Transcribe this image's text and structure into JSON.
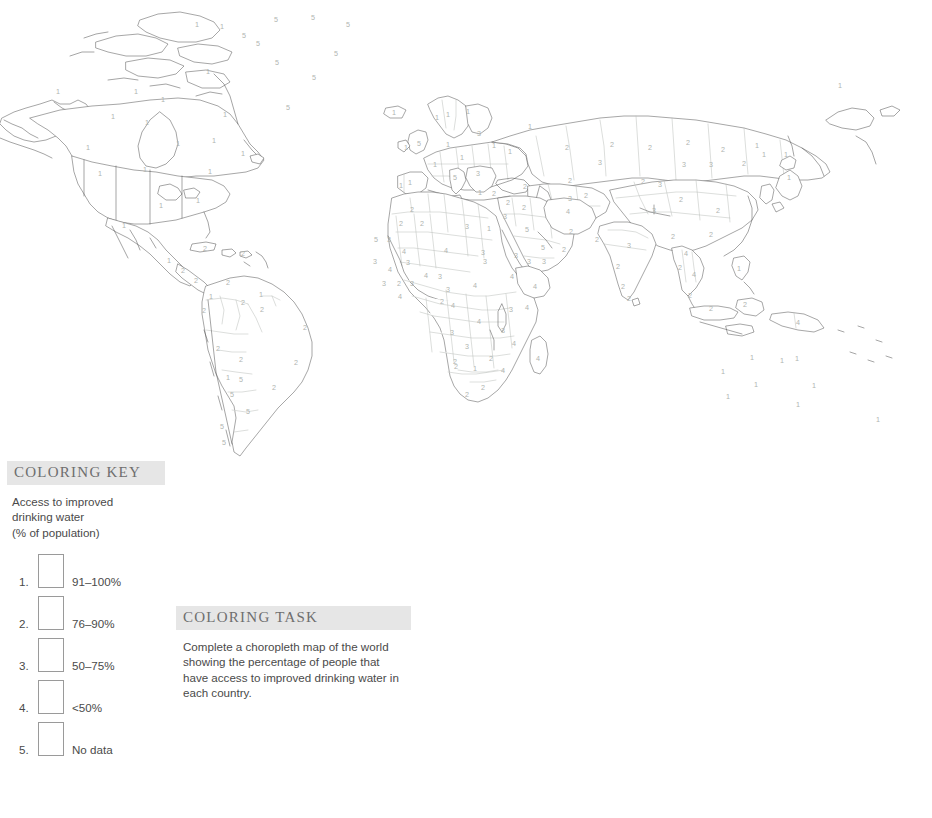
{
  "map": {
    "title": "blank-outline-world-map",
    "description": "Outline world map with country boundaries and a small color-by-number digit inside each country",
    "number_color": "#b0b4b0",
    "outline_color": "#5d5d5d",
    "inner_border_color": "#b9bcb8",
    "fill_color": "#ffffff",
    "country_numbers": [
      {
        "region": "Alaska",
        "value": "1",
        "x": 58,
        "y": 92
      },
      {
        "region": "Canada NW",
        "value": "1",
        "x": 136,
        "y": 92
      },
      {
        "region": "Canada Arctic",
        "value": "1",
        "x": 163,
        "y": 100
      },
      {
        "region": "Canada N",
        "value": "1",
        "x": 197,
        "y": 25
      },
      {
        "region": "Canada NE",
        "value": "1",
        "x": 222,
        "y": 27
      },
      {
        "region": "Nunavut",
        "value": "1",
        "x": 225,
        "y": 115
      },
      {
        "region": "Canada C",
        "value": "1",
        "x": 113,
        "y": 117
      },
      {
        "region": "Canada Hudson",
        "value": "1",
        "x": 208,
        "y": 72
      },
      {
        "region": "Canada Prairies",
        "value": "1",
        "x": 147,
        "y": 123
      },
      {
        "region": "Canada Ontario",
        "value": "1",
        "x": 178,
        "y": 144
      },
      {
        "region": "Canada Quebec",
        "value": "1",
        "x": 214,
        "y": 141
      },
      {
        "region": "Canada East",
        "value": "1",
        "x": 243,
        "y": 154
      },
      {
        "region": "Greenland NW",
        "value": "5",
        "x": 276,
        "y": 20
      },
      {
        "region": "Greenland N",
        "value": "5",
        "x": 313,
        "y": 18
      },
      {
        "region": "Greenland NE",
        "value": "5",
        "x": 348,
        "y": 25
      },
      {
        "region": "Greenland W",
        "value": "5",
        "x": 244,
        "y": 36
      },
      {
        "region": "Greenland C",
        "value": "5",
        "x": 258,
        "y": 44
      },
      {
        "region": "Greenland CE",
        "value": "5",
        "x": 336,
        "y": 54
      },
      {
        "region": "Greenland SW",
        "value": "5",
        "x": 277,
        "y": 63
      },
      {
        "region": "Greenland S",
        "value": "5",
        "x": 314,
        "y": 78
      },
      {
        "region": "Greenland SS",
        "value": "5",
        "x": 288,
        "y": 108
      },
      {
        "region": "USA NW",
        "value": "1",
        "x": 88,
        "y": 148
      },
      {
        "region": "USA W",
        "value": "1",
        "x": 100,
        "y": 174
      },
      {
        "region": "USA C",
        "value": "1",
        "x": 145,
        "y": 170
      },
      {
        "region": "USA NE",
        "value": "1",
        "x": 210,
        "y": 172
      },
      {
        "region": "USA Midwest",
        "value": "1",
        "x": 161,
        "y": 206
      },
      {
        "region": "USA S",
        "value": "1",
        "x": 198,
        "y": 201
      },
      {
        "region": "Mexico N",
        "value": "1",
        "x": 124,
        "y": 226
      },
      {
        "region": "Mexico S",
        "value": "1",
        "x": 169,
        "y": 261
      },
      {
        "region": "Guatemala",
        "value": "2",
        "x": 183,
        "y": 271
      },
      {
        "region": "Cuba",
        "value": "2",
        "x": 205,
        "y": 249
      },
      {
        "region": "Caribbean E",
        "value": "2",
        "x": 243,
        "y": 254
      },
      {
        "region": "Central America S",
        "value": "2",
        "x": 196,
        "y": 281
      },
      {
        "region": "Colombia",
        "value": "1",
        "x": 211,
        "y": 297
      },
      {
        "region": "Venezuela",
        "value": "2",
        "x": 228,
        "y": 283
      },
      {
        "region": "Guyana",
        "value": "1",
        "x": 261,
        "y": 295
      },
      {
        "region": "Suriname",
        "value": "2",
        "x": 262,
        "y": 310
      },
      {
        "region": "Ecuador",
        "value": "2",
        "x": 204,
        "y": 311
      },
      {
        "region": "Brazil N",
        "value": "2",
        "x": 243,
        "y": 303
      },
      {
        "region": "Brazil E",
        "value": "2",
        "x": 305,
        "y": 328
      },
      {
        "region": "Brazil C",
        "value": "2",
        "x": 241,
        "y": 360
      },
      {
        "region": "Brazil S",
        "value": "2",
        "x": 296,
        "y": 363
      },
      {
        "region": "Peru",
        "value": "2",
        "x": 218,
        "y": 349
      },
      {
        "region": "Bolivia",
        "value": "1",
        "x": 228,
        "y": 378
      },
      {
        "region": "Paraguay",
        "value": "5",
        "x": 241,
        "y": 380
      },
      {
        "region": "Uruguay",
        "value": "2",
        "x": 274,
        "y": 388
      },
      {
        "region": "Argentina N",
        "value": "5",
        "x": 232,
        "y": 395
      },
      {
        "region": "Argentina C",
        "value": "5",
        "x": 248,
        "y": 412
      },
      {
        "region": "Chile N",
        "value": "5",
        "x": 222,
        "y": 427
      },
      {
        "region": "Argentina S",
        "value": "5",
        "x": 224,
        "y": 443
      },
      {
        "region": "Iceland",
        "value": "1",
        "x": 394,
        "y": 113
      },
      {
        "region": "Norway",
        "value": "1",
        "x": 437,
        "y": 118
      },
      {
        "region": "Sweden",
        "value": "1",
        "x": 448,
        "y": 115
      },
      {
        "region": "Finland",
        "value": "1",
        "x": 468,
        "y": 112
      },
      {
        "region": "UK",
        "value": "5",
        "x": 419,
        "y": 144
      },
      {
        "region": "Ireland",
        "value": "1",
        "x": 406,
        "y": 148
      },
      {
        "region": "Denmark",
        "value": "1",
        "x": 448,
        "y": 145
      },
      {
        "region": "Baltic",
        "value": "3",
        "x": 479,
        "y": 134
      },
      {
        "region": "Poland",
        "value": "1",
        "x": 494,
        "y": 146
      },
      {
        "region": "Germany",
        "value": "1",
        "x": 462,
        "y": 158
      },
      {
        "region": "France",
        "value": "1",
        "x": 435,
        "y": 165
      },
      {
        "region": "Spain",
        "value": "1",
        "x": 410,
        "y": 183
      },
      {
        "region": "Portugal",
        "value": "1",
        "x": 401,
        "y": 186
      },
      {
        "region": "Italy",
        "value": "5",
        "x": 455,
        "y": 178
      },
      {
        "region": "Balkans",
        "value": "3",
        "x": 478,
        "y": 174
      },
      {
        "region": "Greece",
        "value": "1",
        "x": 480,
        "y": 193
      },
      {
        "region": "Turkey",
        "value": "2",
        "x": 494,
        "y": 194
      },
      {
        "region": "Ukraine",
        "value": "1",
        "x": 510,
        "y": 152
      },
      {
        "region": "Russia W",
        "value": "1",
        "x": 530,
        "y": 127
      },
      {
        "region": "Caucasus",
        "value": "2",
        "x": 525,
        "y": 187
      },
      {
        "region": "Russia C",
        "value": "2",
        "x": 567,
        "y": 148
      },
      {
        "region": "Russia Ural",
        "value": "3",
        "x": 600,
        "y": 163
      },
      {
        "region": "Kazakhstan",
        "value": "2",
        "x": 570,
        "y": 181
      },
      {
        "region": "Siberia W",
        "value": "2",
        "x": 612,
        "y": 145
      },
      {
        "region": "Siberia C",
        "value": "2",
        "x": 650,
        "y": 148
      },
      {
        "region": "Siberia E",
        "value": "2",
        "x": 688,
        "y": 143
      },
      {
        "region": "Siberia NE",
        "value": "2",
        "x": 723,
        "y": 150
      },
      {
        "region": "Russia Far E",
        "value": "1",
        "x": 757,
        "y": 146
      },
      {
        "region": "Russia Pacific",
        "value": "1",
        "x": 840,
        "y": 86
      },
      {
        "region": "Mongolia",
        "value": "3",
        "x": 660,
        "y": 185
      },
      {
        "region": "Mongolia W",
        "value": "3",
        "x": 684,
        "y": 165
      },
      {
        "region": "Mongolia E",
        "value": "3",
        "x": 711,
        "y": 165
      },
      {
        "region": "China N",
        "value": "2",
        "x": 744,
        "y": 164
      },
      {
        "region": "Korea",
        "value": "1",
        "x": 764,
        "y": 155
      },
      {
        "region": "Japan N",
        "value": "1",
        "x": 786,
        "y": 155
      },
      {
        "region": "Japan S",
        "value": "1",
        "x": 789,
        "y": 178
      },
      {
        "region": "China C",
        "value": "2",
        "x": 681,
        "y": 200
      },
      {
        "region": "China W",
        "value": "2",
        "x": 643,
        "y": 182
      },
      {
        "region": "China E",
        "value": "2",
        "x": 718,
        "y": 211
      },
      {
        "region": "China SE",
        "value": "2",
        "x": 711,
        "y": 235
      },
      {
        "region": "China S",
        "value": "2",
        "x": 673,
        "y": 237
      },
      {
        "region": "Nepal",
        "value": "3",
        "x": 654,
        "y": 211
      },
      {
        "region": "India N",
        "value": "3",
        "x": 629,
        "y": 246
      },
      {
        "region": "India C",
        "value": "2",
        "x": 618,
        "y": 267
      },
      {
        "region": "India S",
        "value": "2",
        "x": 623,
        "y": 287
      },
      {
        "region": "Sri Lanka",
        "value": "2",
        "x": 629,
        "y": 299
      },
      {
        "region": "Myanmar",
        "value": "4",
        "x": 686,
        "y": 254
      },
      {
        "region": "Thailand",
        "value": "2",
        "x": 680,
        "y": 268
      },
      {
        "region": "Vietnam",
        "value": "4",
        "x": 694,
        "y": 275
      },
      {
        "region": "Malaysia",
        "value": "2",
        "x": 690,
        "y": 296
      },
      {
        "region": "Philippines",
        "value": "1",
        "x": 739,
        "y": 269
      },
      {
        "region": "Indonesia W",
        "value": "2",
        "x": 711,
        "y": 309
      },
      {
        "region": "Indonesia C",
        "value": "2",
        "x": 745,
        "y": 305
      },
      {
        "region": "Papua New Guinea",
        "value": "4",
        "x": 798,
        "y": 323
      },
      {
        "region": "Australia NW",
        "value": "1",
        "x": 752,
        "y": 358
      },
      {
        "region": "Australia N",
        "value": "1",
        "x": 782,
        "y": 361
      },
      {
        "region": "Australia NE",
        "value": "1",
        "x": 797,
        "y": 359
      },
      {
        "region": "Australia W",
        "value": "1",
        "x": 723,
        "y": 372
      },
      {
        "region": "Australia C",
        "value": "1",
        "x": 756,
        "y": 385
      },
      {
        "region": "Australia E",
        "value": "1",
        "x": 814,
        "y": 386
      },
      {
        "region": "Australia SW",
        "value": "1",
        "x": 728,
        "y": 397
      },
      {
        "region": "Australia SE",
        "value": "1",
        "x": 798,
        "y": 405
      },
      {
        "region": "New Zealand",
        "value": "1",
        "x": 878,
        "y": 420
      },
      {
        "region": "Morocco",
        "value": "2",
        "x": 412,
        "y": 210
      },
      {
        "region": "Algeria",
        "value": "2",
        "x": 422,
        "y": 224
      },
      {
        "region": "Western Sahara",
        "value": "2",
        "x": 401,
        "y": 224
      },
      {
        "region": "Libya",
        "value": "3",
        "x": 467,
        "y": 227
      },
      {
        "region": "Egypt",
        "value": "1",
        "x": 489,
        "y": 229
      },
      {
        "region": "Sudan",
        "value": "3",
        "x": 485,
        "y": 262
      },
      {
        "region": "Mauritania",
        "value": "5",
        "x": 376,
        "y": 240
      },
      {
        "region": "Mali N",
        "value": "3",
        "x": 389,
        "y": 240
      },
      {
        "region": "Mali",
        "value": "4",
        "x": 404,
        "y": 252
      },
      {
        "region": "Niger",
        "value": "4",
        "x": 446,
        "y": 251
      },
      {
        "region": "Chad",
        "value": "3",
        "x": 483,
        "y": 253
      },
      {
        "region": "Senegal",
        "value": "3",
        "x": 375,
        "y": 262
      },
      {
        "region": "Guinea",
        "value": "4",
        "x": 390,
        "y": 270
      },
      {
        "region": "Burkina",
        "value": "3",
        "x": 408,
        "y": 263
      },
      {
        "region": "Benin",
        "value": "4",
        "x": 426,
        "y": 276
      },
      {
        "region": "Nigeria",
        "value": "3",
        "x": 440,
        "y": 277
      },
      {
        "region": "Sierra Leone",
        "value": "3",
        "x": 384,
        "y": 284
      },
      {
        "region": "Liberia",
        "value": "2",
        "x": 399,
        "y": 284
      },
      {
        "region": "Ivory Coast",
        "value": "3",
        "x": 412,
        "y": 284
      },
      {
        "region": "Cameroon",
        "value": "3",
        "x": 448,
        "y": 290
      },
      {
        "region": "CAR",
        "value": "4",
        "x": 475,
        "y": 286
      },
      {
        "region": "Ethiopia",
        "value": "4",
        "x": 512,
        "y": 277
      },
      {
        "region": "Somalia",
        "value": "4",
        "x": 535,
        "y": 287
      },
      {
        "region": "Eq Guinea",
        "value": "4",
        "x": 400,
        "y": 297
      },
      {
        "region": "Gabon",
        "value": "2",
        "x": 442,
        "y": 302
      },
      {
        "region": "Congo",
        "value": "4",
        "x": 453,
        "y": 306
      },
      {
        "region": "DRC",
        "value": "4",
        "x": 479,
        "y": 322
      },
      {
        "region": "Uganda",
        "value": "3",
        "x": 511,
        "y": 310
      },
      {
        "region": "Kenya",
        "value": "4",
        "x": 527,
        "y": 308
      },
      {
        "region": "Angola N",
        "value": "3",
        "x": 452,
        "y": 333
      },
      {
        "region": "Tanzania",
        "value": "3",
        "x": 503,
        "y": 331
      },
      {
        "region": "Zambia",
        "value": "3",
        "x": 467,
        "y": 347
      },
      {
        "region": "Mozambique",
        "value": "4",
        "x": 514,
        "y": 344
      },
      {
        "region": "Madagascar",
        "value": "4",
        "x": 538,
        "y": 359
      },
      {
        "region": "Zimbabwe",
        "value": "2",
        "x": 491,
        "y": 359
      },
      {
        "region": "Botswana",
        "value": "2",
        "x": 455,
        "y": 362
      },
      {
        "region": "Namibia",
        "value": "2",
        "x": 456,
        "y": 367
      },
      {
        "region": "South Africa N",
        "value": "1",
        "x": 475,
        "y": 369
      },
      {
        "region": "Malawi",
        "value": "4",
        "x": 503,
        "y": 371
      },
      {
        "region": "South Africa",
        "value": "2",
        "x": 483,
        "y": 388
      },
      {
        "region": "South Africa S",
        "value": "2",
        "x": 467,
        "y": 395
      },
      {
        "region": "Saudi Arabia",
        "value": "5",
        "x": 527,
        "y": 230
      },
      {
        "region": "Iraq",
        "value": "2",
        "x": 524,
        "y": 208
      },
      {
        "region": "Iran",
        "value": "4",
        "x": 568,
        "y": 212
      },
      {
        "region": "Syria",
        "value": "2",
        "x": 508,
        "y": 203
      },
      {
        "region": "Jordan",
        "value": "3",
        "x": 505,
        "y": 217
      },
      {
        "region": "UAE",
        "value": "5",
        "x": 543,
        "y": 248
      },
      {
        "region": "Oman",
        "value": "2",
        "x": 564,
        "y": 250
      },
      {
        "region": "Yemen",
        "value": "3",
        "x": 529,
        "y": 262
      },
      {
        "region": "Yemen E",
        "value": "3",
        "x": 544,
        "y": 262
      },
      {
        "region": "Afghanistan",
        "value": "2",
        "x": 571,
        "y": 232
      },
      {
        "region": "Pakistan",
        "value": "2",
        "x": 597,
        "y": 240
      },
      {
        "region": "Turkmenistan",
        "value": "3",
        "x": 570,
        "y": 199
      },
      {
        "region": "Uzbekistan",
        "value": "2",
        "x": 586,
        "y": 196
      },
      {
        "region": "Eritrea",
        "value": "3",
        "x": 516,
        "y": 256
      }
    ]
  },
  "coloring_key": {
    "header": "COLORING KEY",
    "subtitle_lines": [
      "Access to improved",
      "drinking water",
      "(% of population)"
    ],
    "items": [
      {
        "index": "1.",
        "label": "91–100%",
        "swatch_fill": "#ffffff"
      },
      {
        "index": "2.",
        "label": "76–90%",
        "swatch_fill": "#ffffff"
      },
      {
        "index": "3.",
        "label": "50–75%",
        "swatch_fill": "#ffffff"
      },
      {
        "index": "4.",
        "label": "<50%",
        "swatch_fill": "#ffffff"
      },
      {
        "index": "5.",
        "label": "No data",
        "swatch_fill": "#ffffff"
      }
    ]
  },
  "coloring_task": {
    "header": "COLORING TASK",
    "text": "Complete a choropleth map of the world showing the percentage of people that have access to improved drinking water in each country."
  },
  "theme": {
    "page_background": "#ffffff",
    "header_bar_background": "#e6e6e6",
    "header_text_color": "#6e6e6e",
    "body_text_color": "#4a4a4a",
    "swatch_border_color": "#9a9a9a"
  }
}
